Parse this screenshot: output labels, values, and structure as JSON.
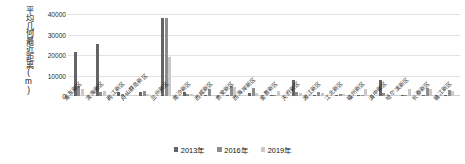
{
  "chart_data": {
    "type": "bar",
    "title": "",
    "xlabel": "",
    "ylabel": "平均几何最近距离(m)",
    "ylim": [
      0,
      40000
    ],
    "yticks": [
      "0",
      "10000",
      "20000",
      "30000",
      "40000"
    ],
    "grid": true,
    "legend_position": "bottom",
    "categories": [
      "浦东新区",
      "滨海新区",
      "两江新区",
      "舟山群岛新区",
      "兰州新区",
      "南沙新区",
      "西咸新区",
      "贵安新区",
      "西海岸新区",
      "金普新区",
      "天府新区",
      "湘江新区",
      "江北新区",
      "福州新区",
      "滇中新区",
      "哈尔滨新区",
      "长春新区",
      "赣江新区"
    ],
    "series": [
      {
        "name": "2013年",
        "color": "#646464",
        "values": [
          21500,
          25500,
          1800,
          2100,
          37900,
          1900,
          0,
          0,
          1500,
          0,
          7700,
          0,
          0,
          0,
          7600,
          0,
          0,
          0
        ]
      },
      {
        "name": "2016年",
        "color": "#8c8c8c",
        "values": [
          5100,
          2000,
          1200,
          2400,
          38000,
          1100,
          3600,
          4800,
          4100,
          0,
          1900,
          2100,
          1100,
          0,
          1500,
          0,
          3700,
          3100
        ]
      },
      {
        "name": "2019年",
        "color": "#c9c9c9",
        "values": [
          3200,
          2300,
          1600,
          900,
          19000,
          800,
          0,
          4200,
          1700,
          2300,
          1400,
          1300,
          900,
          3600,
          1100,
          3500,
          3500,
          2600
        ]
      }
    ]
  },
  "legend": {
    "items": [
      {
        "label": "2013年",
        "color": "#646464"
      },
      {
        "label": "2016年",
        "color": "#8c8c8c"
      },
      {
        "label": "2019年",
        "color": "#c9c9c9"
      }
    ]
  }
}
